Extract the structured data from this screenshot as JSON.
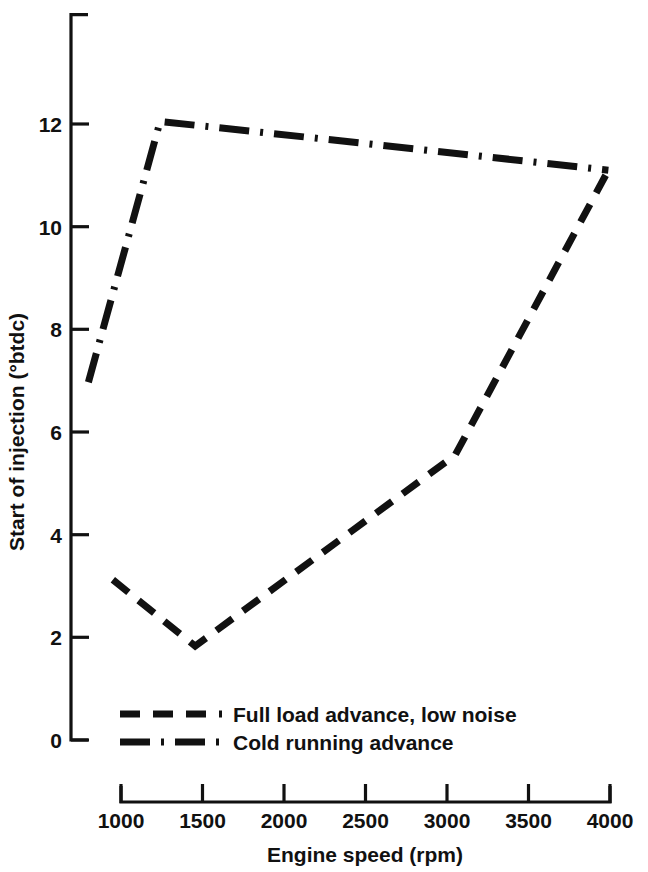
{
  "chart_data": {
    "type": "line",
    "title": "",
    "xlabel": "Engine speed (rpm)",
    "ylabel": "Start of injection (°btdc)",
    "xlim": [
      800,
      4050
    ],
    "ylim": [
      0,
      12.6
    ],
    "xticks": [
      1000,
      1500,
      2000,
      2500,
      3000,
      3500,
      4000
    ],
    "xtick_labels": [
      "1000",
      "1500",
      "2000",
      "2500",
      "3000",
      "3500",
      "4000"
    ],
    "yticks": [
      0,
      2,
      4,
      6,
      8,
      10,
      12
    ],
    "ytick_labels": [
      "0",
      "2",
      "4",
      "6",
      "8",
      "10",
      "12"
    ],
    "grid": false,
    "legend_position": "lower-left-inside",
    "series": [
      {
        "name": "Full load advance, low noise",
        "dash": "dashed",
        "color": "#111111",
        "x": [
          950,
          1455,
          3050,
          3990
        ],
        "y": [
          3.12,
          1.83,
          5.55,
          11.1
        ]
      },
      {
        "name": "Cold running advance",
        "dash": "dash-dot",
        "color": "#111111",
        "x": [
          800,
          1240,
          2500,
          3990
        ],
        "y": [
          6.97,
          12.05,
          11.62,
          11.1
        ]
      }
    ]
  },
  "axes": {
    "x_title": "Engine speed (rpm)",
    "y_title": "Start of injection (°btdc)",
    "x_tick_labels": [
      "1000",
      "1500",
      "2000",
      "2500",
      "3000",
      "3500",
      "4000"
    ],
    "y_tick_labels": [
      "0",
      "2",
      "4",
      "6",
      "8",
      "10",
      "12"
    ]
  },
  "legend": {
    "items": [
      {
        "label": "Full load advance, low noise",
        "style": "dashed"
      },
      {
        "label": "Cold running advance",
        "style": "dash-dot"
      }
    ]
  },
  "colors": {
    "ink": "#111111",
    "background": "#ffffff"
  }
}
